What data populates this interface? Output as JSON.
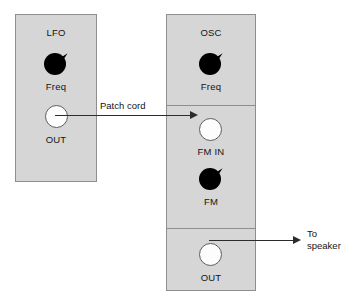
{
  "diagram": {
    "colors": {
      "panel_fill": "#d6d6d6",
      "panel_border": "#8e8e8e",
      "knob": "#000000",
      "jack_fill": "#fdfdfd",
      "jack_ring": "#5c5c5c",
      "wire": "#2b2b2b",
      "text": "#141414",
      "background": "#ffffff"
    }
  },
  "modules": [
    {
      "id": "lfo",
      "title": "LFO",
      "sections": [
        {
          "controls": [
            {
              "type": "knob",
              "label": "Freq"
            },
            {
              "type": "jack",
              "label": "OUT"
            }
          ]
        }
      ]
    },
    {
      "id": "osc",
      "title": "OSC",
      "sections": [
        {
          "controls": [
            {
              "type": "knob",
              "label": "Freq"
            }
          ]
        },
        {
          "controls": [
            {
              "type": "jack",
              "label": "FM IN"
            },
            {
              "type": "knob",
              "label": "FM"
            }
          ]
        },
        {
          "controls": [
            {
              "type": "jack",
              "label": "OUT"
            }
          ]
        }
      ]
    }
  ],
  "connections": [
    {
      "id": "patch-cord",
      "label": "Patch cord",
      "from": "LFO OUT",
      "to": "OSC FM IN"
    },
    {
      "id": "speaker-out",
      "label_line1": "To",
      "label_line2": "speaker",
      "from": "OSC OUT",
      "to": "speaker"
    }
  ],
  "labels": {
    "lfo_title": "LFO",
    "lfo_freq": "Freq",
    "lfo_out": "OUT",
    "osc_title": "OSC",
    "osc_freq": "Freq",
    "osc_fm_in": "FM IN",
    "osc_fm": "FM",
    "osc_out": "OUT",
    "patch_cord": "Patch cord",
    "to_speaker_1": "To",
    "to_speaker_2": "speaker"
  }
}
